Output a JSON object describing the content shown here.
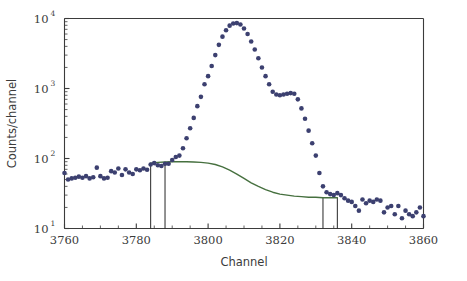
{
  "figure": {
    "background_color": "#ffffff",
    "point_color": "#3c4070",
    "curve_color": "#46703f",
    "axis_color": "#3b3b3b",
    "marker_color": "#262626"
  },
  "axes": {
    "x_title": "Channel",
    "y_title": "Counts/channel",
    "x_ticks": [
      "3760",
      "3780",
      "3800",
      "3820",
      "3840",
      "3860"
    ],
    "x_tick_values": [
      3760,
      3780,
      3800,
      3820,
      3840,
      3860
    ],
    "y_ticks": [
      "10",
      "10",
      "10",
      "10"
    ],
    "y_tick_exponents": [
      "1",
      "2",
      "3",
      "4"
    ],
    "y_tick_values": [
      10,
      100,
      1000,
      10000
    ],
    "xlim": [
      3760,
      3860
    ],
    "ylim": [
      10,
      10000
    ],
    "x_scale": "linear",
    "y_scale": "log",
    "grid": "off",
    "x_minor_tick_interval": 5,
    "y_minor_ticks": "log-decade-subdivisions"
  },
  "markers": {
    "label": "region-of-interest boundaries",
    "channels": [
      3784,
      3788,
      3832,
      3836
    ]
  },
  "chart_data": {
    "type": "scatter",
    "title": "",
    "subtitle": "",
    "xlabel": "Channel",
    "ylabel": "Counts/channel",
    "xlim": [
      3760,
      3860
    ],
    "ylim": [
      10,
      10000
    ],
    "yscale": "log",
    "xscale": "linear",
    "grid": false,
    "legend": "none",
    "annotations": [
      "Four vertical marker lines delimit background-fit regions at channels 3784, 3788, 3832 and 3836",
      "Main photopeak centred near channel 3807 reaching about 8500 counts/channel",
      "Secondary shoulder near channel 3820 at about 900 counts/channel"
    ],
    "series": [
      {
        "name": "spectrum",
        "type": "scatter",
        "marker": "circle",
        "color": "#3c4070",
        "x": [
          3760,
          3761,
          3762,
          3763,
          3764,
          3765,
          3766,
          3767,
          3768,
          3769,
          3770,
          3771,
          3772,
          3773,
          3774,
          3775,
          3776,
          3777,
          3778,
          3779,
          3780,
          3781,
          3782,
          3783,
          3784,
          3785,
          3786,
          3787,
          3788,
          3789,
          3790,
          3791,
          3792,
          3793,
          3794,
          3795,
          3796,
          3797,
          3798,
          3799,
          3800,
          3801,
          3802,
          3803,
          3804,
          3805,
          3806,
          3807,
          3808,
          3809,
          3810,
          3811,
          3812,
          3813,
          3814,
          3815,
          3816,
          3817,
          3818,
          3819,
          3820,
          3821,
          3822,
          3823,
          3824,
          3825,
          3826,
          3827,
          3828,
          3829,
          3830,
          3831,
          3832,
          3833,
          3834,
          3835,
          3836,
          3837,
          3838,
          3839,
          3840,
          3841,
          3842,
          3843,
          3844,
          3845,
          3846,
          3847,
          3848,
          3849,
          3850,
          3851,
          3852,
          3853,
          3854,
          3855,
          3856,
          3857,
          3858,
          3859,
          3860
        ],
        "y": [
          62,
          50,
          52,
          53,
          55,
          53,
          56,
          52,
          54,
          74,
          56,
          52,
          53,
          66,
          63,
          72,
          58,
          70,
          63,
          60,
          70,
          68,
          72,
          69,
          82,
          86,
          80,
          78,
          84,
          84,
          95,
          105,
          110,
          140,
          195,
          270,
          380,
          560,
          760,
          1150,
          1500,
          2100,
          3000,
          4200,
          5500,
          6800,
          7900,
          8500,
          8600,
          8200,
          7200,
          6000,
          4700,
          3600,
          2700,
          2000,
          1500,
          1150,
          900,
          820,
          800,
          820,
          840,
          860,
          840,
          700,
          520,
          370,
          250,
          165,
          110,
          62,
          40,
          33,
          31,
          30,
          32,
          30,
          27,
          25,
          24,
          21,
          18,
          26,
          23,
          25,
          24,
          26,
          25,
          17,
          20,
          21,
          16,
          21,
          14,
          18,
          16,
          15,
          17,
          20,
          15
        ]
      },
      {
        "name": "background fit",
        "type": "line",
        "color": "#46703f",
        "x": [
          3784,
          3786,
          3788,
          3790,
          3792,
          3794,
          3796,
          3798,
          3800,
          3802,
          3804,
          3806,
          3808,
          3810,
          3812,
          3814,
          3816,
          3818,
          3820,
          3822,
          3824,
          3826,
          3828,
          3830,
          3832,
          3834,
          3836
        ],
        "y": [
          86,
          88,
          89,
          90,
          90,
          90,
          89,
          88,
          86,
          82,
          76,
          68,
          60,
          52,
          45,
          40,
          36,
          33,
          31,
          30,
          29,
          28.5,
          28,
          28,
          27.5,
          27.5,
          27.5
        ]
      }
    ]
  }
}
